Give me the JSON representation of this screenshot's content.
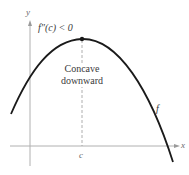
{
  "diagram": {
    "axes": {
      "x_label": "x",
      "y_label": "y"
    },
    "point_label": "c",
    "condition_label": "f″(c) < 0",
    "region_label_line1": "Concave",
    "region_label_line2": "downward",
    "curve_label": "f",
    "colors": {
      "curve": "#1a1a1a",
      "axes": "#a8a8a8",
      "dashed_line": "#9a9a9a",
      "text": "#3a3a3a"
    }
  }
}
